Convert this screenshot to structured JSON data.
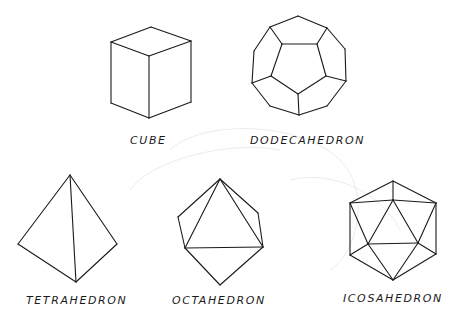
{
  "figure": {
    "line_color": "#1a1a1a",
    "background": "#ffffff"
  },
  "solids": [
    {
      "key": "cube",
      "label": "CUBE",
      "edges": [
        [
          [
            151,
            27
          ],
          [
            111,
            42
          ]
        ],
        [
          [
            151,
            27
          ],
          [
            191,
            41
          ]
        ],
        [
          [
            111,
            42
          ],
          [
            149,
            56
          ]
        ],
        [
          [
            191,
            41
          ],
          [
            149,
            56
          ]
        ],
        [
          [
            111,
            42
          ],
          [
            111,
            103
          ]
        ],
        [
          [
            191,
            41
          ],
          [
            191,
            102
          ]
        ],
        [
          [
            149,
            56
          ],
          [
            149,
            118
          ]
        ],
        [
          [
            111,
            103
          ],
          [
            149,
            118
          ]
        ],
        [
          [
            191,
            102
          ],
          [
            149,
            118
          ]
        ]
      ]
    },
    {
      "key": "dodecahedron",
      "label": "DODECAHEDRON",
      "edges": [
        [
          [
            298,
            16
          ],
          [
            270,
            27
          ]
        ],
        [
          [
            270,
            27
          ],
          [
            254,
            51
          ]
        ],
        [
          [
            254,
            51
          ],
          [
            252,
            83
          ]
        ],
        [
          [
            252,
            83
          ],
          [
            270,
            106
          ]
        ],
        [
          [
            270,
            106
          ],
          [
            299,
            115
          ]
        ],
        [
          [
            299,
            115
          ],
          [
            327,
            106
          ]
        ],
        [
          [
            327,
            106
          ],
          [
            346,
            81
          ]
        ],
        [
          [
            346,
            81
          ],
          [
            345,
            49
          ]
        ],
        [
          [
            345,
            49
          ],
          [
            327,
            28
          ]
        ],
        [
          [
            327,
            28
          ],
          [
            298,
            16
          ]
        ],
        [
          [
            282,
            44
          ],
          [
            317,
            44
          ]
        ],
        [
          [
            317,
            44
          ],
          [
            326,
            76
          ]
        ],
        [
          [
            326,
            76
          ],
          [
            298,
            94
          ]
        ],
        [
          [
            298,
            94
          ],
          [
            271,
            76
          ]
        ],
        [
          [
            271,
            76
          ],
          [
            282,
            44
          ]
        ],
        [
          [
            270,
            27
          ],
          [
            282,
            44
          ]
        ],
        [
          [
            327,
            28
          ],
          [
            317,
            44
          ]
        ],
        [
          [
            346,
            81
          ],
          [
            326,
            76
          ]
        ],
        [
          [
            299,
            115
          ],
          [
            298,
            94
          ]
        ],
        [
          [
            252,
            83
          ],
          [
            271,
            76
          ]
        ]
      ]
    },
    {
      "key": "tetrahedron",
      "label": "TETRAHEDRON",
      "edges": [
        [
          [
            70,
            175
          ],
          [
            18,
            244
          ]
        ],
        [
          [
            70,
            175
          ],
          [
            117,
            244
          ]
        ],
        [
          [
            70,
            175
          ],
          [
            76,
            282
          ]
        ],
        [
          [
            18,
            244
          ],
          [
            76,
            282
          ]
        ],
        [
          [
            117,
            244
          ],
          [
            76,
            282
          ]
        ]
      ]
    },
    {
      "key": "octahedron",
      "label": "OCTAHEDRON",
      "edges": [
        [
          [
            220,
            179
          ],
          [
            178,
            217
          ]
        ],
        [
          [
            220,
            179
          ],
          [
            185,
            248
          ]
        ],
        [
          [
            220,
            179
          ],
          [
            258,
            213
          ]
        ],
        [
          [
            220,
            179
          ],
          [
            263,
            247
          ]
        ],
        [
          [
            178,
            217
          ],
          [
            185,
            248
          ]
        ],
        [
          [
            258,
            213
          ],
          [
            263,
            247
          ]
        ],
        [
          [
            185,
            248
          ],
          [
            263,
            247
          ]
        ],
        [
          [
            185,
            248
          ],
          [
            220,
            285
          ]
        ],
        [
          [
            263,
            247
          ],
          [
            220,
            285
          ]
        ]
      ]
    },
    {
      "key": "icosahedron",
      "label": "ICOSAHEDRON",
      "edges": [
        [
          [
            393,
            181
          ],
          [
            350,
            203
          ]
        ],
        [
          [
            393,
            181
          ],
          [
            436,
            203
          ]
        ],
        [
          [
            393,
            181
          ],
          [
            393,
            200
          ]
        ],
        [
          [
            350,
            203
          ],
          [
            393,
            200
          ]
        ],
        [
          [
            436,
            203
          ],
          [
            393,
            200
          ]
        ],
        [
          [
            350,
            203
          ],
          [
            350,
            255
          ]
        ],
        [
          [
            436,
            203
          ],
          [
            436,
            254
          ]
        ],
        [
          [
            393,
            200
          ],
          [
            368,
            244
          ]
        ],
        [
          [
            393,
            200
          ],
          [
            418,
            243
          ]
        ],
        [
          [
            368,
            244
          ],
          [
            418,
            243
          ]
        ],
        [
          [
            350,
            203
          ],
          [
            368,
            244
          ]
        ],
        [
          [
            436,
            203
          ],
          [
            418,
            243
          ]
        ],
        [
          [
            350,
            255
          ],
          [
            368,
            244
          ]
        ],
        [
          [
            436,
            254
          ],
          [
            418,
            243
          ]
        ],
        [
          [
            350,
            255
          ],
          [
            393,
            280
          ]
        ],
        [
          [
            436,
            254
          ],
          [
            393,
            280
          ]
        ],
        [
          [
            368,
            244
          ],
          [
            393,
            280
          ]
        ],
        [
          [
            418,
            243
          ],
          [
            393,
            280
          ]
        ]
      ]
    }
  ]
}
